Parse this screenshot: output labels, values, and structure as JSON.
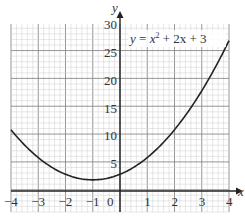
{
  "chart_data": {
    "type": "line",
    "title": "",
    "equation_label": "y = x² + 2x + 3",
    "xlabel": "x",
    "ylabel": "y",
    "xlim": [
      -4,
      4
    ],
    "ylim": [
      0,
      30
    ],
    "grid": true,
    "x_ticks": [
      -4,
      -3,
      -2,
      -1,
      0,
      1,
      2,
      3,
      4
    ],
    "y_ticks": [
      5,
      10,
      15,
      20,
      25,
      30
    ],
    "series": [
      {
        "name": "y = x^2 + 2x + 3",
        "x": [
          -4,
          -3,
          -2,
          -1,
          0,
          1,
          2,
          3,
          4
        ],
        "y": [
          11,
          6,
          3,
          2,
          3,
          6,
          11,
          18,
          27
        ]
      }
    ]
  },
  "labels": {
    "x_axis": "x",
    "y_axis": "y",
    "origin": "0",
    "eq_y": "y",
    "eq_eq": " = ",
    "eq_x": "x",
    "eq_sup": "2",
    "eq_rest": " + 2x + 3",
    "xt": [
      "−4",
      "−3",
      "−2",
      "−1",
      "1",
      "2",
      "3",
      "4"
    ],
    "yt": [
      "5",
      "10",
      "15",
      "20",
      "25",
      "30"
    ]
  }
}
